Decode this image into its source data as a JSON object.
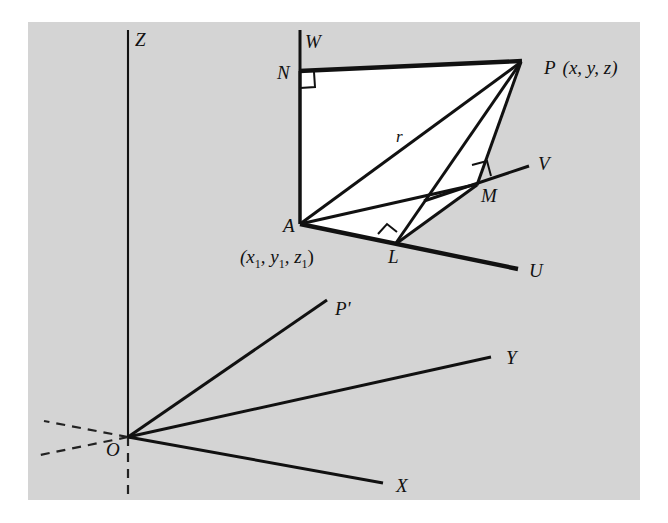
{
  "figure": {
    "kind": "3d-coordinate-geometry-diagram",
    "background_color": "#d4d4d4",
    "page_color": "#ffffff",
    "ink_color": "#111111"
  },
  "axes": [
    {
      "id": "Z",
      "label": "Z",
      "label_x": 135,
      "label_y": 46,
      "from": [
        128,
        437
      ],
      "to": [
        128,
        30
      ]
    },
    {
      "id": "X",
      "label": "X",
      "label_x": 396,
      "label_y": 492,
      "from": [
        128,
        437
      ],
      "to": [
        381,
        482
      ]
    },
    {
      "id": "Y",
      "label": "Y",
      "label_x": 506,
      "label_y": 364,
      "from": [
        128,
        437
      ],
      "to": [
        489,
        358
      ]
    },
    {
      "id": "Pprime",
      "label": "P'",
      "label_x": 337,
      "label_y": 314,
      "from": [
        128,
        437
      ],
      "to": [
        326,
        301
      ]
    },
    {
      "id": "W",
      "label": "W",
      "label_x": 305,
      "label_y": 48,
      "from": [
        300,
        30
      ],
      "to": [
        300,
        224
      ]
    },
    {
      "id": "U",
      "label": "U",
      "label_x": 529,
      "label_y": 277,
      "from": [
        300,
        224
      ],
      "to": [
        516,
        268
      ]
    },
    {
      "id": "V",
      "label": "V",
      "label_x": 540,
      "label_y": 170,
      "from": [
        424,
        201
      ],
      "to": [
        527,
        167
      ]
    }
  ],
  "points": [
    {
      "id": "P",
      "label": "P",
      "coords_text": "(x, y, z)",
      "label_x": 546,
      "label_y": 73,
      "x": 521,
      "y": 62
    },
    {
      "id": "A",
      "label": "A",
      "coords_text": "(x",
      "label_x": 285,
      "label_y": 231,
      "x": 300,
      "y": 224
    },
    {
      "id": "N",
      "label": "N",
      "label_x": 279,
      "label_y": 79,
      "x": 300,
      "y": 72
    },
    {
      "id": "L",
      "label": "L",
      "label_x": 390,
      "label_y": 262,
      "x": 397,
      "y": 242
    },
    {
      "id": "M",
      "label": "M",
      "label_x": 483,
      "label_y": 201,
      "x": 477,
      "y": 184
    },
    {
      "id": "O",
      "label": "O",
      "label_x": 108,
      "label_y": 455,
      "x": 128,
      "y": 437
    }
  ],
  "labels": {
    "radius": "r",
    "radius_x": 399,
    "radius_y": 141,
    "point_P_name": "P",
    "point_P_coords": "(x, y, z)",
    "point_A_name": "A",
    "point_A_coords_open": "(x",
    "point_A_sub1": "1",
    "point_A_mid1": ", y",
    "point_A_sub2": "1",
    "point_A_mid2": ", z",
    "point_A_sub3": "1",
    "point_A_close": ")",
    "point_A_coords_full": "(x1, y1, z1)",
    "axis_Z": "Z",
    "axis_X": "X",
    "axis_Y": "Y",
    "axis_W": "W",
    "axis_U": "U",
    "axis_V": "V",
    "label_Pprime": "P'",
    "label_N": "N",
    "label_L": "L",
    "label_M": "M",
    "label_O": "O"
  },
  "segments": [
    {
      "name": "segment-N-P",
      "from": [
        300,
        72
      ],
      "to": [
        521,
        62
      ],
      "weight": "thick"
    },
    {
      "name": "segment-A-N",
      "from": [
        300,
        224
      ],
      "to": [
        300,
        72
      ],
      "weight": "med"
    },
    {
      "name": "segment-A-P",
      "from": [
        300,
        224
      ],
      "to": [
        521,
        62
      ],
      "weight": "med"
    },
    {
      "name": "segment-A-L-radius",
      "from": [
        300,
        224
      ],
      "to": [
        521,
        62
      ],
      "weight": "med"
    },
    {
      "name": "segment-L-P",
      "from": [
        397,
        242
      ],
      "to": [
        521,
        62
      ],
      "weight": "med"
    },
    {
      "name": "segment-P-M",
      "from": [
        521,
        62
      ],
      "to": [
        477,
        184
      ],
      "weight": "med"
    },
    {
      "name": "segment-A-M",
      "from": [
        300,
        224
      ],
      "to": [
        477,
        184
      ],
      "weight": "med"
    },
    {
      "name": "segment-A-L",
      "from": [
        300,
        224
      ],
      "to": [
        397,
        242
      ],
      "weight": "thick"
    },
    {
      "name": "segment-L-U",
      "from": [
        397,
        242
      ],
      "to": [
        516,
        268
      ],
      "weight": "thick"
    },
    {
      "name": "segment-L-M",
      "from": [
        397,
        242
      ],
      "to": [
        477,
        184
      ],
      "weight": "med"
    },
    {
      "name": "segment-M-V",
      "from": [
        477,
        184
      ],
      "to": [
        527,
        167
      ],
      "weight": "med"
    }
  ],
  "right_angles": [
    {
      "name": "right-angle-at-N",
      "at": [
        300,
        72
      ]
    },
    {
      "name": "right-angle-at-L",
      "at": [
        397,
        242
      ]
    },
    {
      "name": "right-angle-at-M",
      "at": [
        477,
        184
      ]
    }
  ],
  "dashed_lines": [
    {
      "name": "dashed-x-negative",
      "from": [
        128,
        437
      ],
      "to": [
        44,
        421
      ]
    },
    {
      "name": "dashed-y-negative",
      "from": [
        128,
        437
      ],
      "to": [
        40,
        455
      ]
    },
    {
      "name": "dashed-z-negative",
      "from": [
        128,
        437
      ],
      "to": [
        128,
        492
      ]
    }
  ]
}
